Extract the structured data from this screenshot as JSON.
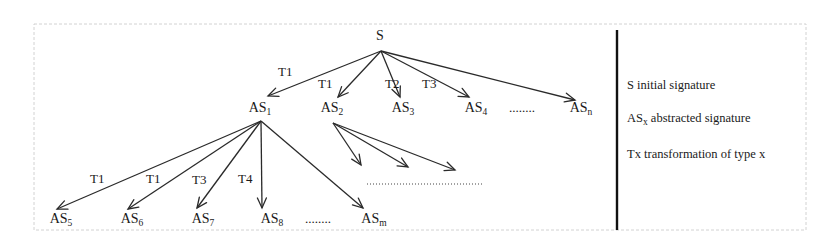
{
  "diagram": {
    "root": {
      "id": "S",
      "label": "S",
      "x": 380,
      "y": 40
    },
    "level1": [
      {
        "id": "AS1",
        "base": "AS",
        "sub": "1",
        "x": 260,
        "y": 112,
        "edge_label": "T1",
        "lx": 278,
        "ly": 76,
        "ax": 268,
        "ay": 96
      },
      {
        "id": "AS2",
        "base": "AS",
        "sub": "2",
        "x": 332,
        "y": 112,
        "edge_label": "T1",
        "lx": 318,
        "ly": 88,
        "ax": 338,
        "ay": 97
      },
      {
        "id": "AS3",
        "base": "AS",
        "sub": "3",
        "x": 403,
        "y": 112,
        "edge_label": "T2",
        "lx": 385,
        "ly": 88,
        "ax": 400,
        "ay": 97
      },
      {
        "id": "AS4",
        "base": "AS",
        "sub": "4",
        "x": 476,
        "y": 112,
        "edge_label": "T3",
        "lx": 422,
        "ly": 88,
        "ax": 469,
        "ay": 97
      },
      {
        "id": "ASn",
        "base": "AS",
        "sub": "n",
        "x": 581,
        "y": 112,
        "edge_label": "",
        "lx": 0,
        "ly": 0,
        "ax": 575,
        "ay": 100
      }
    ],
    "level1_ellipsis": {
      "text": "........",
      "x": 522,
      "y": 112
    },
    "level2": [
      {
        "id": "AS5",
        "base": "AS",
        "sub": "5",
        "x": 61,
        "y": 223,
        "edge_label": "T1",
        "lx": 90,
        "ly": 183,
        "ax": 57,
        "ay": 209
      },
      {
        "id": "AS6",
        "base": "AS",
        "sub": "6",
        "x": 132,
        "y": 223,
        "edge_label": "T1",
        "lx": 146,
        "ly": 183,
        "ax": 128,
        "ay": 209
      },
      {
        "id": "AS7",
        "base": "AS",
        "sub": "7",
        "x": 203,
        "y": 223,
        "edge_label": "T3",
        "lx": 192,
        "ly": 184,
        "ax": 197,
        "ay": 208
      },
      {
        "id": "AS8",
        "base": "AS",
        "sub": "8",
        "x": 272,
        "y": 223,
        "edge_label": "T4",
        "lx": 238,
        "ly": 183,
        "ax": 262,
        "ay": 208
      },
      {
        "id": "ASm",
        "base": "AS",
        "sub": "m",
        "x": 374,
        "y": 223,
        "edge_label": "",
        "lx": 0,
        "ly": 0,
        "ax": 363,
        "ay": 208
      }
    ],
    "level2_ellipsis": {
      "text": "........",
      "x": 318,
      "y": 223
    },
    "as2_children_arrows": [
      {
        "ax": 361,
        "ay": 165
      },
      {
        "ax": 408,
        "ay": 167
      },
      {
        "ax": 455,
        "ay": 170
      }
    ],
    "as2_children_dotted": {
      "x1": 367,
      "x2": 482,
      "y": 184
    },
    "legend": [
      {
        "symbol": "S",
        "sub": "",
        "desc": " initial signature",
        "y": 89
      },
      {
        "symbol": "AS",
        "sub": "x",
        "desc": " abstracted signature",
        "y": 122
      },
      {
        "symbol": "Tx",
        "sub": "",
        "desc": " transformation of type x",
        "y": 158
      }
    ],
    "colors": {
      "line": "#2a2a2a",
      "text": "#1a1a1a",
      "frame": "#d2d2d2",
      "divider": "#111111"
    }
  }
}
